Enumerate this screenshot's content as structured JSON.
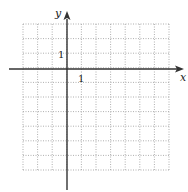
{
  "chart_data": {
    "type": "coordinate-grid",
    "title": "",
    "xlabel": "x",
    "ylabel": "y",
    "x_tick_label": "1",
    "y_tick_label": "1",
    "xlim": [
      -3,
      7
    ],
    "ylim": [
      -7,
      3
    ],
    "grid": true,
    "grid_style": "dotted",
    "data": []
  },
  "axes": {
    "x_label": "x",
    "y_label": "y",
    "x_unit_label": "1",
    "y_unit_label": "1"
  },
  "colors": {
    "axis": "#333333",
    "grid": "#9a9a9a",
    "background": "#ffffff"
  }
}
